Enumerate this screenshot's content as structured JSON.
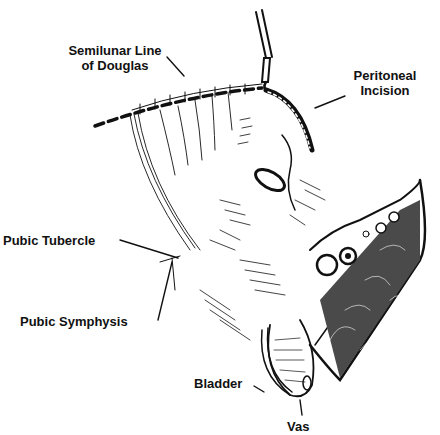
{
  "figure": {
    "type": "anatomical line drawing",
    "colors": {
      "ink": "#111111",
      "background": "#ffffff"
    }
  },
  "labels": {
    "semilunar_line": {
      "line1": "Semilunar Line",
      "line2": "of Douglas"
    },
    "peritoneal_incision": {
      "line1": "Peritoneal",
      "line2": "Incision"
    },
    "pubic_tubercle": "Pubic Tubercle",
    "pubic_symphysis": "Pubic Symphysis",
    "bladder": "Bladder",
    "vas": "Vas"
  }
}
